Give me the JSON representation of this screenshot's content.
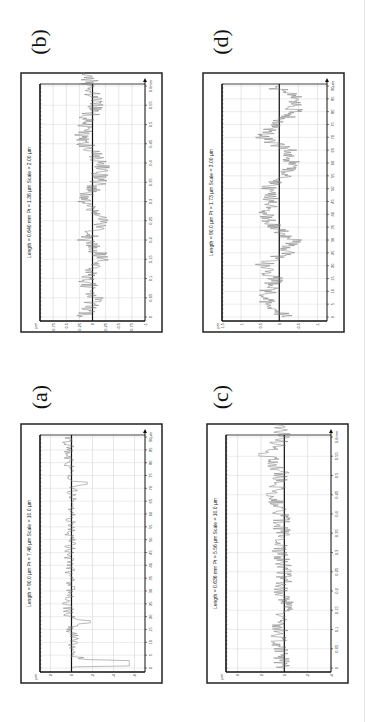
{
  "figure": {
    "panels": [
      {
        "id": "b",
        "label": "(b)",
        "title": "Length = 0.640 mm  Pt = 1.36 µm  Scale = 2.00 µm",
        "y_unit": "µm",
        "x_unit": "mm",
        "y_ticks": [
          "0.75",
          "0.5",
          "0.25",
          "0",
          "-0.25",
          "-0.5",
          "-0.75",
          "-1"
        ],
        "x_ticks": [
          "0",
          "0.05",
          "0.1",
          "0.15",
          "0.2",
          "0.25",
          "0.3",
          "0.35",
          "0.4",
          "0.45",
          "0.5",
          "0.55",
          "0.6mm"
        ]
      },
      {
        "id": "d",
        "label": "(d)",
        "title": "Length = 90.0 µm  Pt = 1.73 µm  Scale = 3.00 µm",
        "y_unit": "µm",
        "x_unit": "µm",
        "y_ticks": [
          "1.5",
          "1",
          "0.5",
          "0",
          "-0.5",
          "-1"
        ],
        "x_ticks": [
          "0",
          "5",
          "10",
          "15",
          "20",
          "25",
          "30",
          "35",
          "40",
          "45",
          "50",
          "55",
          "60",
          "65",
          "70",
          "75",
          "80",
          "85",
          "90µm"
        ]
      },
      {
        "id": "a",
        "label": "(a)",
        "title": "Length = 90.0 µm  Pt = 7.46 µm  Scale = 10.0 µm",
        "y_unit": "µm",
        "x_unit": "µm",
        "y_ticks": [
          "2",
          "0",
          "-2",
          "-4",
          "-6"
        ],
        "x_ticks": [
          "0",
          "5",
          "10",
          "15",
          "20",
          "25",
          "30",
          "35",
          "40",
          "45",
          "50",
          "55",
          "60",
          "65",
          "70",
          "75",
          "80",
          "85",
          "90µm"
        ]
      },
      {
        "id": "c",
        "label": "(c)",
        "title": "Length = 0.636 mm  Pt = 5.56 µm  Scale = 10.0 µm",
        "y_unit": "µm",
        "x_unit": "mm",
        "y_ticks": [
          "4",
          "2",
          "0",
          "-2",
          "-4"
        ],
        "x_ticks": [
          "0",
          "0.05",
          "0.1",
          "0.15",
          "0.2",
          "0.25",
          "0.3",
          "0.35",
          "0.4",
          "0.45",
          "0.5",
          "0.55",
          "0.6mm"
        ]
      }
    ]
  },
  "chart_data": [
    {
      "type": "line",
      "panel": "(b)",
      "title": "Length = 0.640 mm  Pt = 1.36 µm  Scale = 2.00 µm",
      "xlabel": "mm",
      "ylabel": "µm",
      "xlim": [
        0,
        0.64
      ],
      "ylim": [
        -1,
        1
      ],
      "grid": true,
      "x": [
        0,
        0.05,
        0.1,
        0.15,
        0.2,
        0.25,
        0.3,
        0.35,
        0.4,
        0.45,
        0.5,
        0.55,
        0.6
      ],
      "values": [
        0.3,
        -0.1,
        0.25,
        -0.35,
        0.2,
        -0.3,
        0.35,
        -0.2,
        -0.3,
        0.25,
        0.3,
        -0.15,
        0.1
      ],
      "note": "high-frequency roughness profile, amplitude mostly within ±0.5 µm"
    },
    {
      "type": "line",
      "panel": "(d)",
      "title": "Length = 90.0 µm  Pt = 1.73 µm  Scale = 3.00 µm",
      "xlabel": "µm",
      "ylabel": "µm",
      "xlim": [
        0,
        90
      ],
      "ylim": [
        -1.25,
        1.5
      ],
      "grid": true,
      "x": [
        0,
        5,
        10,
        15,
        20,
        25,
        30,
        35,
        40,
        45,
        50,
        55,
        60,
        65,
        70,
        75,
        80,
        85,
        90
      ],
      "values": [
        -0.3,
        0.6,
        0.5,
        0.2,
        0.8,
        -0.3,
        -0.6,
        0.2,
        0.6,
        0.3,
        0.6,
        -0.4,
        -0.5,
        -0.4,
        0.8,
        0.1,
        -0.6,
        -0.8,
        0.3
      ],
      "note": "profile oscillating roughly between -1 and 1 µm"
    },
    {
      "type": "line",
      "panel": "(a)",
      "title": "Length = 90.0 µm  Pt = 7.46 µm  Scale = 10.0 µm",
      "xlabel": "µm",
      "ylabel": "µm",
      "xlim": [
        0,
        90
      ],
      "ylim": [
        -7,
        3
      ],
      "grid": true,
      "x": [
        0,
        2,
        5,
        10,
        12,
        15,
        18,
        20,
        25,
        30,
        40,
        50,
        60,
        70,
        72,
        75,
        80,
        85,
        90
      ],
      "values": [
        0,
        -5.5,
        0.2,
        -0.5,
        -1,
        0.8,
        -1.8,
        0.5,
        0.8,
        0.3,
        0.5,
        0.3,
        0.2,
        -0.3,
        -1.5,
        0.3,
        0.8,
        0.5,
        1.2
      ],
      "note": "mostly flat near 0 with deep valley (~-5.5 µm) near x≈2 µm"
    },
    {
      "type": "line",
      "panel": "(c)",
      "title": "Length = 0.636 mm  Pt = 5.56 µm  Scale = 10.0 µm",
      "xlabel": "mm",
      "ylabel": "µm",
      "xlim": [
        0,
        0.636
      ],
      "ylim": [
        -4,
        5
      ],
      "grid": true,
      "x": [
        0,
        0.05,
        0.1,
        0.15,
        0.2,
        0.25,
        0.3,
        0.35,
        0.4,
        0.45,
        0.5,
        0.55,
        0.6
      ],
      "values": [
        0.3,
        0.5,
        0.8,
        -0.3,
        0.2,
        -0.2,
        0.6,
        0.3,
        0.4,
        1.5,
        0.2,
        2.2,
        0.3
      ],
      "note": "small roughness around 0 with isolated peaks up to ~2 µm near 0.55 mm"
    }
  ]
}
